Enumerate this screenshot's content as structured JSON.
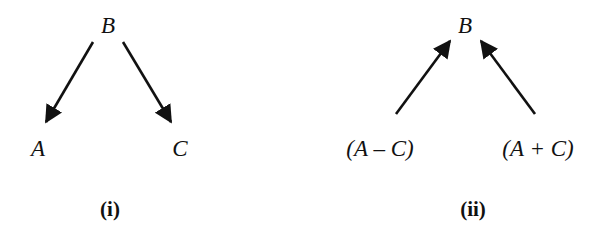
{
  "colors": {
    "background": "#ffffff",
    "ink": "#111111"
  },
  "diagrams": [
    {
      "id": "i",
      "caption": "(i)",
      "top_node": "B",
      "bottom_nodes": [
        "A",
        "C"
      ],
      "edges": [
        {
          "from": "B",
          "to": "A",
          "direction": "down"
        },
        {
          "from": "B",
          "to": "C",
          "direction": "down"
        }
      ]
    },
    {
      "id": "ii",
      "caption": "(ii)",
      "top_node": "B",
      "bottom_nodes": [
        "(A – C)",
        "(A + C)"
      ],
      "edges": [
        {
          "from": "(A – C)",
          "to": "B",
          "direction": "up"
        },
        {
          "from": "(A + C)",
          "to": "B",
          "direction": "up"
        }
      ]
    }
  ]
}
